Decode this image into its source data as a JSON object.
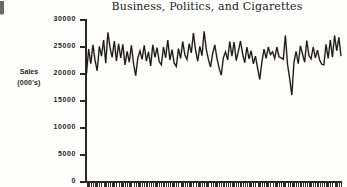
{
  "figure": {
    "title": "Business, Politics, and Cigarettes",
    "y_axis_title_line1": "Sales",
    "y_axis_title_line2": "(000's)",
    "line_color": "#1c1a18",
    "background_color": "#fdfdfc",
    "axis_color": "#2b2926"
  },
  "chart_data": {
    "type": "line",
    "title": "Business, Politics, and Cigarettes",
    "subtitle": "",
    "xlabel": "",
    "ylabel": "Sales (000's)",
    "ylim": [
      0,
      30000
    ],
    "yticks": [
      0,
      5000,
      10000,
      15000,
      20000,
      25000,
      30000
    ],
    "ytick_labels": [
      "0",
      "5000",
      "10000",
      "15000",
      "20000",
      "25000",
      "30000"
    ],
    "xlim": [
      0,
      119
    ],
    "xticks_count": 120,
    "xtick_labels": [],
    "grid": false,
    "legend": null,
    "legend_position": "none",
    "annotations": [],
    "series": [
      {
        "name": "Cigarette Sales",
        "values": [
          20100,
          24600,
          21900,
          25400,
          22500,
          20600,
          25100,
          23300,
          26300,
          22000,
          27700,
          24900,
          23100,
          26100,
          22400,
          25600,
          23000,
          25500,
          21700,
          24200,
          22200,
          25300,
          21900,
          19700,
          23000,
          24300,
          22700,
          25300,
          22400,
          24100,
          21500,
          25400,
          23100,
          24900,
          22300,
          21700,
          25000,
          23000,
          26300,
          22600,
          24500,
          22000,
          21400,
          24700,
          22900,
          26000,
          23500,
          22700,
          25600,
          23900,
          27600,
          24400,
          22400,
          25100,
          23400,
          27900,
          24600,
          22700,
          21300,
          23800,
          25400,
          22900,
          21100,
          19800,
          23000,
          24100,
          22600,
          26000,
          23300,
          25900,
          22500,
          24200,
          26100,
          23700,
          22100,
          25000,
          22800,
          24300,
          21900,
          23300,
          21100,
          19000,
          22200,
          24600,
          22900,
          25000,
          23600,
          24100,
          22900,
          25000,
          23200,
          23000,
          22700,
          27100,
          21800,
          19200,
          16100,
          22100,
          24200,
          21900,
          25200,
          23700,
          22200,
          26200,
          23400,
          22800,
          25000,
          23000,
          24400,
          22600,
          21800,
          21700,
          25500,
          22900,
          26300,
          23100,
          27100,
          24300,
          26800,
          23300
        ]
      }
    ]
  }
}
